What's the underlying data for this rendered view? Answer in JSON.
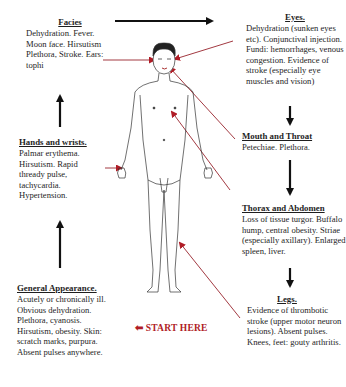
{
  "diagram": {
    "type": "clinical examination flow",
    "accent_color": "#b01c26",
    "arrow_color": "#111111",
    "start_label": "START HERE",
    "sections": [
      {
        "id": "facies",
        "title": "Facies",
        "text": "Dehydration. Fever. Moon face. Hirsutism Plethora, Stroke. Ears: tophi"
      },
      {
        "id": "eyes",
        "title": "Eyes.",
        "text": "Dehydration (sunken eyes etc). Conjunctival injection. Fundi: hemorrhages, venous congestion. Evidence of stroke (especially eye muscles and vision)"
      },
      {
        "id": "hands",
        "title": "Hands and wrists.",
        "text": "Palmar erythema. Hirsutism. Rapid thready pulse, tachycardia. Hypertension."
      },
      {
        "id": "mouth",
        "title": "Mouth and Throat",
        "text": "Petechiae. Plethora."
      },
      {
        "id": "thorax",
        "title": "Thorax and Abdomen",
        "text": "Loss of tissue turgor. Buffalo hump, central obesity. Striae (especially axillary). Enlarged spleen, liver."
      },
      {
        "id": "general",
        "title": "General Appearance.",
        "text": "Acutely or chronically ill. Obvious dehydration. Plethora, cyanosis. Hirsutism, obesity. Skin: scratch marks, purpura. Absent pulses anywhere."
      },
      {
        "id": "legs",
        "title": "Legs.",
        "text": "Evidence of thrombotic stroke (upper motor neuron lesions). Absent pulses. Knees, feet: gouty arthritis."
      }
    ],
    "flow_order": [
      "General Appearance.",
      "Hands and wrists.",
      "Facies",
      "Eyes.",
      "Mouth and Throat",
      "Thorax and Abdomen",
      "Legs."
    ],
    "figure": "human-body-outline"
  }
}
